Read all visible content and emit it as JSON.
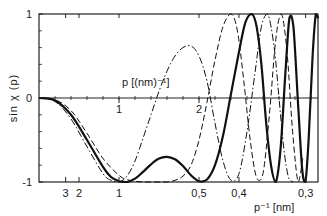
{
  "chart_data": {
    "type": "line",
    "title": "",
    "ylabel": "sin χ (p)",
    "xlabel_top": "p [(nm)⁻¹]",
    "xlabel_bottom": "p⁻¹ [nm]",
    "ylim": [
      -1,
      1
    ],
    "xlim_p": [
      0,
      3.49
    ],
    "grid": false,
    "legend": null,
    "y_ticks": [
      {
        "value": 1,
        "label": "1"
      },
      {
        "value": 0,
        "label": "0"
      },
      {
        "value": -1,
        "label": "-1"
      }
    ],
    "y_minor_ticks": [
      0.8,
      0.6,
      0.4,
      0.2,
      -0.2,
      -0.4,
      -0.6,
      -0.8
    ],
    "top_axis_ticks_p": [
      {
        "p": 1,
        "label": "1"
      },
      {
        "p": 2,
        "label": "2"
      }
    ],
    "zero_line_ticks_p": [
      0.2,
      0.4,
      0.6,
      0.8,
      1.0,
      1.2,
      1.4,
      1.6,
      1.8,
      2.0,
      2.2,
      2.4,
      2.6,
      2.8,
      3.0,
      3.2,
      3.4
    ],
    "bottom_axis_ticks": [
      {
        "p": 0.333,
        "label": "3"
      },
      {
        "p": 0.5,
        "label": "2"
      },
      {
        "p": 1.0,
        "label": "1"
      },
      {
        "p": 2.0,
        "label": "0,5"
      },
      {
        "p": 2.5,
        "label": "0,4"
      },
      {
        "p": 3.333,
        "label": "0,3"
      }
    ],
    "series": [
      {
        "name": "solid",
        "style": "solid",
        "width": 2.2,
        "x": [
          0,
          0.2,
          0.4,
          0.6,
          0.8,
          0.9,
          1.0,
          1.1,
          1.2,
          1.3,
          1.4,
          1.5,
          1.6,
          1.7,
          1.8,
          1.9,
          2.0,
          2.1,
          2.2,
          2.3,
          2.4,
          2.5,
          2.58,
          2.66,
          2.72,
          2.78,
          2.84,
          2.9,
          2.96,
          3.02,
          3.08,
          3.13,
          3.18,
          3.24,
          3.29,
          3.33,
          3.37,
          3.42,
          3.46,
          3.49
        ],
        "values": [
          0,
          -0.03,
          -0.2,
          -0.5,
          -0.82,
          -0.94,
          -0.99,
          -1.0,
          -0.96,
          -0.88,
          -0.79,
          -0.72,
          -0.7,
          -0.73,
          -0.81,
          -0.92,
          -0.99,
          -0.97,
          -0.8,
          -0.45,
          0.05,
          0.55,
          0.9,
          1.0,
          0.85,
          0.4,
          -0.3,
          -0.8,
          -1.0,
          -0.6,
          0.3,
          0.95,
          0.85,
          -0.1,
          -0.85,
          -1.0,
          -0.5,
          0.5,
          1.0,
          0.95
        ]
      },
      {
        "name": "dashed",
        "style": "dashed",
        "width": 1.0,
        "x": [
          0,
          0.2,
          0.4,
          0.6,
          0.8,
          1.0,
          1.1,
          1.2,
          1.3,
          1.4,
          1.5,
          1.6,
          1.7,
          1.8,
          1.9,
          2.0,
          2.1,
          2.2,
          2.3,
          2.4,
          2.48,
          2.56,
          2.64,
          2.72,
          2.8,
          2.88,
          2.96,
          3.03,
          3.1,
          3.17,
          3.24,
          3.3
        ],
        "values": [
          0,
          -0.02,
          -0.15,
          -0.42,
          -0.72,
          -0.92,
          -0.97,
          -0.99,
          -1.0,
          -1.0,
          -1.0,
          -1.0,
          -0.98,
          -0.93,
          -0.8,
          -0.5,
          -0.05,
          0.45,
          0.85,
          1.0,
          0.8,
          0.2,
          -0.5,
          -0.95,
          -0.9,
          -0.2,
          0.7,
          1.0,
          0.55,
          -0.4,
          -1.0,
          -0.7
        ]
      },
      {
        "name": "dash-dot",
        "style": "dashdot",
        "width": 1.0,
        "x": [
          0,
          0.2,
          0.4,
          0.6,
          0.8,
          0.9,
          1.0,
          1.1,
          1.2,
          1.3,
          1.4,
          1.5,
          1.6,
          1.7,
          1.8,
          1.9,
          2.0,
          2.1,
          2.2,
          2.3,
          2.4,
          2.5,
          2.6,
          2.7,
          2.78,
          2.86,
          2.94,
          3.0,
          3.06,
          3.12,
          3.18
        ],
        "values": [
          0,
          -0.04,
          -0.25,
          -0.58,
          -0.9,
          -0.98,
          -1.0,
          -0.93,
          -0.75,
          -0.48,
          -0.2,
          0.08,
          0.32,
          0.5,
          0.6,
          0.62,
          0.5,
          0.2,
          -0.3,
          -0.75,
          -0.98,
          -0.9,
          -0.4,
          0.3,
          0.85,
          1.0,
          0.6,
          0.0,
          -0.6,
          -0.95,
          -1.0
        ]
      }
    ]
  },
  "labels": {
    "y_axis": "sin χ (p)",
    "top_axis": "p [(nm)⁻¹]",
    "bottom_axis": "p⁻¹ [nm]"
  }
}
